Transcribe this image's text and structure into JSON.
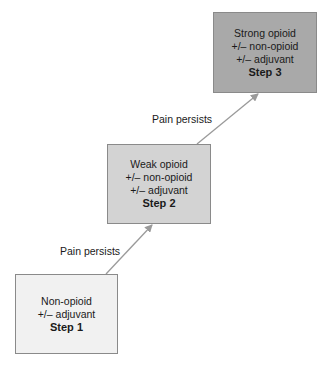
{
  "diagram": {
    "type": "staircase",
    "steps": [
      {
        "lines": [
          "Non-opioid",
          "+/– adjuvant"
        ],
        "step_label": "Step 1",
        "fill": "#f1f1f1"
      },
      {
        "lines": [
          "Weak opioid",
          "+/– non-opioid",
          "+/– adjuvant"
        ],
        "step_label": "Step 2",
        "fill": "#d3d3d3"
      },
      {
        "lines": [
          "Strong opioid",
          "+/– non-opioid",
          "+/– adjuvant"
        ],
        "step_label": "Step 3",
        "fill": "#a9a9a9"
      }
    ],
    "transitions": [
      {
        "from": "Step 1",
        "to": "Step 2",
        "label": "Pain persists"
      },
      {
        "from": "Step 2",
        "to": "Step 3",
        "label": "Pain persists"
      }
    ],
    "colors": {
      "border": "#8a8a8a",
      "arrow": "#9a9a9a",
      "text": "#1a1a1a"
    }
  }
}
